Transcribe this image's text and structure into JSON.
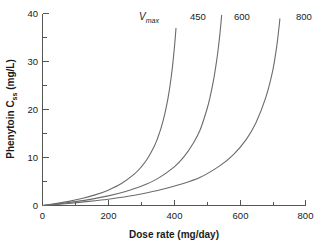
{
  "chart_data": {
    "type": "line",
    "title": "",
    "xlabel": "Dose rate (mg/day)",
    "ylabel": "Phenytoin C",
    "ylabel_sub": "ss",
    "ylabel_units": " (mg/L)",
    "legend_title": "V",
    "legend_title_sub": "max",
    "xlim": [
      0,
      800
    ],
    "ylim": [
      0,
      40
    ],
    "xticks": [
      0,
      200,
      400,
      600,
      800
    ],
    "xtick_labels": [
      "0",
      "200",
      "400",
      "600",
      "800"
    ],
    "xticks_minor": [
      100,
      300,
      500,
      700
    ],
    "yticks": [
      0,
      10,
      20,
      30,
      40
    ],
    "ytick_labels": [
      "0",
      "10",
      "20",
      "30",
      "40"
    ],
    "yticks_minor": [
      5,
      15,
      25,
      35
    ],
    "grid": false,
    "legend_position": "top-inside",
    "model": "Michaelis-Menten steady state: Css = Km * Dose / (Vmax - Dose)",
    "km": 4,
    "series": [
      {
        "name": "450",
        "label": "450",
        "vmax": 450,
        "color": "#6b6b6b",
        "x": [
          0,
          40,
          80,
          120,
          160,
          200,
          240,
          280,
          300,
          320,
          340,
          350,
          360,
          370,
          380,
          385,
          390,
          395,
          400,
          403,
          405,
          406
        ],
        "y": [
          0.0,
          0.39,
          0.86,
          1.45,
          2.21,
          3.2,
          4.57,
          6.59,
          8.0,
          9.85,
          12.36,
          14.0,
          16.0,
          18.5,
          21.71,
          23.69,
          26.0,
          28.73,
          32.0,
          34.3,
          36.0,
          36.9
        ]
      },
      {
        "name": "600",
        "label": "600",
        "vmax": 600,
        "color": "#6b6b6b",
        "x": [
          0,
          50,
          100,
          150,
          200,
          250,
          300,
          350,
          400,
          430,
          460,
          480,
          500,
          510,
          520,
          530,
          535,
          540,
          543,
          545
        ],
        "y": [
          0.0,
          0.36,
          0.8,
          1.33,
          2.0,
          2.86,
          4.0,
          5.6,
          8.0,
          10.12,
          13.14,
          15.83,
          20.0,
          22.67,
          26.0,
          30.29,
          32.92,
          36.0,
          38.11,
          39.64
        ]
      },
      {
        "name": "800",
        "label": "800",
        "vmax": 800,
        "color": "#6b6b6b",
        "x": [
          0,
          70,
          140,
          210,
          280,
          350,
          420,
          480,
          540,
          580,
          620,
          650,
          680,
          700,
          710,
          715,
          720,
          722
        ],
        "y": [
          0.0,
          0.38,
          0.85,
          1.42,
          2.15,
          3.11,
          4.42,
          5.88,
          8.31,
          10.55,
          13.78,
          17.33,
          22.67,
          28.0,
          32.0,
          34.47,
          37.5,
          38.87
        ]
      }
    ]
  },
  "axes": {
    "x_title": "Dose rate (mg/day)",
    "y_title_main": "Phenytoin C",
    "y_title_sub": "ss",
    "y_title_tail": " (mg/L)"
  },
  "labels": {
    "vmax_main": "V",
    "vmax_sub": "max",
    "curve_450": "450",
    "curve_600": "600",
    "curve_800": "800",
    "x_0": "0",
    "x_200": "200",
    "x_400": "400",
    "x_600": "600",
    "x_800": "800",
    "y_0": "0",
    "y_10": "10",
    "y_20": "20",
    "y_30": "30",
    "y_40": "40"
  },
  "colors": {
    "background": "#ffffff",
    "axis": "#555555",
    "curve": "#6b6b6b",
    "text": "#1a1a1a"
  }
}
